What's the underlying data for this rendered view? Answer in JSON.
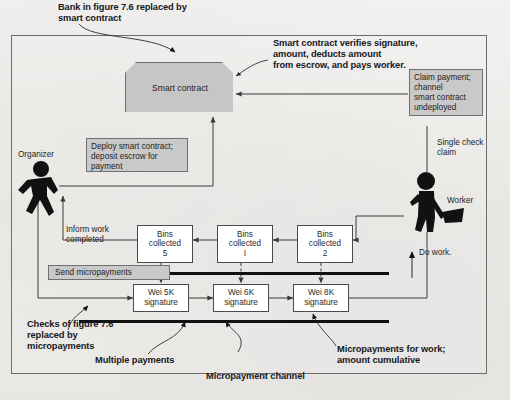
{
  "figure": {
    "title_note": "Bank in figure 7.6 replaced by smart contract",
    "background_color": "#efeeec",
    "frame_color": "#6c6c6c",
    "accent_gray": "#c9c9c9"
  },
  "callouts": [
    {
      "id": "bank-replaced",
      "text": "Bank in figure 7.6 replaced by smart contract"
    },
    {
      "id": "sc-verifies",
      "text": "Smart contract verifies signature, amount, deducts amount from escrow, and pays worker."
    },
    {
      "id": "checks-replaced",
      "text": "Checks of figure 7.6 replaced by micropayments"
    },
    {
      "id": "multiple-payments",
      "text": "Multiple payments"
    },
    {
      "id": "micropayment-channel",
      "text": "Micropayment channel"
    },
    {
      "id": "micropayments-work",
      "text": "Micropayments for work; amount cumulative"
    }
  ],
  "callout_lines": {
    "bank_replaced": [
      "Bank in figure 7.6 replaced by",
      "smart contract"
    ],
    "sc_verifies": [
      "Smart contract verifies signature,",
      "amount, deducts amount",
      "from escrow, and pays worker."
    ],
    "checks_replaced": [
      "Checks of figure 7.6",
      "replaced by",
      "micropayments"
    ],
    "multiple_payments": "Multiple payments",
    "micropayment_channel": "Micropayment channel",
    "micropayments_work": [
      "Micropayments for work;",
      "amount cumulative"
    ]
  },
  "nodes": {
    "smart_contract": {
      "label": "Smart contract"
    },
    "deploy_note": {
      "lines": [
        "Deploy smart contract;",
        "deposit escrow for",
        "payment"
      ]
    },
    "claim_note": {
      "lines": [
        "Claim payment;",
        "channel",
        "smart contract",
        "undeployed"
      ]
    },
    "send_micropayments": {
      "label": "Send micropayments"
    }
  },
  "actors": {
    "organizer": {
      "label": "Organizer",
      "icon": "walking-person-icon"
    },
    "worker": {
      "label": "Worker",
      "icon": "worker-with-shovel-icon"
    }
  },
  "edge_labels": {
    "inform_work": [
      "Inform work",
      "completed"
    ],
    "single_check_claim": [
      "Single check",
      "claim"
    ],
    "do_work": "Do work."
  },
  "bins": [
    {
      "lines": [
        "Bins",
        "collected",
        "5"
      ]
    },
    {
      "lines": [
        "Bins",
        "collected",
        "I"
      ]
    },
    {
      "lines": [
        "Bins",
        "collected",
        "2"
      ]
    }
  ],
  "signatures": [
    {
      "lines": [
        "Wei 5K",
        "signature"
      ]
    },
    {
      "lines": [
        "Wei 6K",
        "signature"
      ]
    },
    {
      "lines": [
        "Wei 8K",
        "signature"
      ]
    }
  ]
}
